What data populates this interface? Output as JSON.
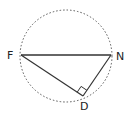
{
  "diagram": {
    "type": "geometry",
    "circle": {
      "cx": 66,
      "cy": 56,
      "r": 46,
      "style": "dotted"
    },
    "points": {
      "F": {
        "label": "F",
        "x": 21,
        "y": 55
      },
      "N": {
        "label": "N",
        "x": 111,
        "y": 55
      },
      "D": {
        "label": "D",
        "x": 83,
        "y": 96
      }
    },
    "segments": [
      [
        "F",
        "N"
      ],
      [
        "F",
        "D"
      ],
      [
        "D",
        "N"
      ]
    ],
    "right_angle_at": "D",
    "colors": {
      "line": "#333333",
      "dashed": "#555555"
    }
  }
}
